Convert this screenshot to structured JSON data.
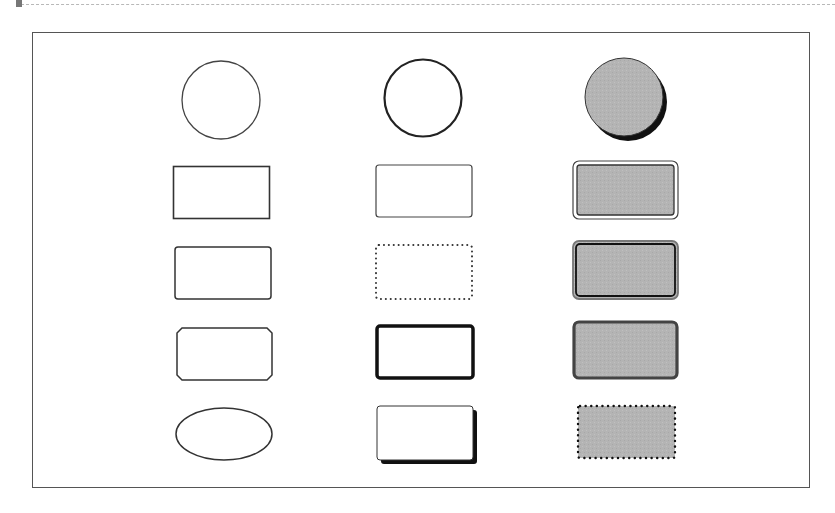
{
  "diagram": {
    "title": "",
    "colors": {
      "stroke": "#333333",
      "fill_gray": "#b4b4b4",
      "shadow": "#111111",
      "frame": "#555555"
    },
    "columns": [
      {
        "name": "plain-outline",
        "shapes": [
          "circle-thin-outline",
          "rectangle-square-corners",
          "rectangle-rounded-corners",
          "rectangle-beveled-corners",
          "ellipse-outline"
        ]
      },
      {
        "name": "styled-outline",
        "shapes": [
          "circle-medium-outline",
          "rectangle-rounded-thin",
          "rectangle-rounded-dotted",
          "rectangle-rounded-thick",
          "rectangle-rounded-drop-shadow"
        ]
      },
      {
        "name": "gray-filled",
        "shapes": [
          "circle-filled-drop-shadow",
          "rectangle-filled-double-border-outer-thin",
          "rectangle-filled-double-border-inner-thick",
          "rectangle-filled-thick-gray-border",
          "rectangle-filled-dotted-border"
        ]
      }
    ]
  }
}
